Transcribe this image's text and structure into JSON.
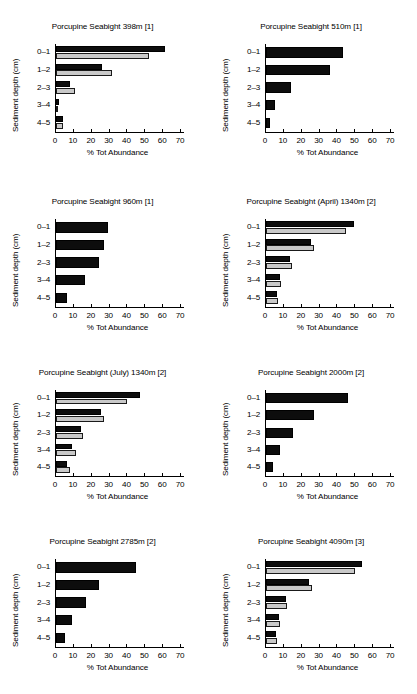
{
  "figure": {
    "panel_count": 8,
    "columns": 2,
    "rows": 4
  },
  "axes": {
    "xlabel": "% Tot Abundance",
    "ylabel": "Sediment depth (cm)",
    "xticks": [
      "0",
      "10",
      "20",
      "30",
      "40",
      "50",
      "60",
      "70"
    ],
    "xlim": [
      0,
      70
    ],
    "depth_categories": [
      "0–1",
      "1–2",
      "2–3",
      "3–4",
      "4–5"
    ],
    "grid": false,
    "legend": "none"
  },
  "colors": {
    "series_a": "#0d0d0d",
    "series_b": "#c9c9c9",
    "axis": "#000000",
    "background": "#ffffff"
  },
  "chart_data": [
    {
      "type": "bar",
      "title": "Porcupine Seabight 398m [1]",
      "xlabel": "% Tot Abundance",
      "ylabel": "Sediment depth (cm)",
      "xlim": [
        0,
        70
      ],
      "categories": [
        "0–1",
        "1–2",
        "2–3",
        "3–4",
        "4–5"
      ],
      "series": [
        {
          "name": "series_a",
          "color": "#0d0d0d",
          "values": [
            61,
            26,
            8,
            1.5,
            4
          ]
        },
        {
          "name": "series_b",
          "color": "#c9c9c9",
          "values": [
            52,
            31.5,
            10.5,
            1,
            4
          ]
        }
      ]
    },
    {
      "type": "bar",
      "title": "Porcupine Seabight 510m [1]",
      "xlabel": "% Tot Abundance",
      "ylabel": "Sediment depth (cm)",
      "xlim": [
        0,
        70
      ],
      "categories": [
        "0–1",
        "1–2",
        "2–3",
        "3–4",
        "4–5"
      ],
      "series": [
        {
          "name": "series_a",
          "color": "#0d0d0d",
          "values": [
            43,
            36,
            14,
            5,
            2.5
          ]
        }
      ]
    },
    {
      "type": "bar",
      "title": "Porcupine Seabight 960m [1]",
      "xlabel": "% Tot Abundance",
      "ylabel": "Sediment depth (cm)",
      "xlim": [
        0,
        70
      ],
      "categories": [
        "0–1",
        "1–2",
        "2–3",
        "3–4",
        "4–5"
      ],
      "series": [
        {
          "name": "series_a",
          "color": "#0d0d0d",
          "values": [
            29,
            27,
            24,
            16,
            6
          ]
        }
      ]
    },
    {
      "type": "bar",
      "title": "Porcupine Seabight (April) 1340m [2]",
      "xlabel": "% Tot Abundance",
      "ylabel": "Sediment depth (cm)",
      "xlim": [
        0,
        70
      ],
      "categories": [
        "0–1",
        "1–2",
        "2–3",
        "3–4",
        "4–5"
      ],
      "series": [
        {
          "name": "series_a",
          "color": "#0d0d0d",
          "values": [
            49,
            25,
            13.5,
            8,
            6
          ]
        },
        {
          "name": "series_b",
          "color": "#c9c9c9",
          "values": [
            45,
            27,
            14.5,
            8.5,
            6.5
          ]
        }
      ]
    },
    {
      "type": "bar",
      "title": "Porcupine Seabight (July) 1340m [2]",
      "xlabel": "% Tot Abundance",
      "ylabel": "Sediment depth (cm)",
      "xlim": [
        0,
        70
      ],
      "categories": [
        "0–1",
        "1–2",
        "2–3",
        "3–4",
        "4–5"
      ],
      "series": [
        {
          "name": "series_a",
          "color": "#0d0d0d",
          "values": [
            47,
            25,
            14,
            9,
            6
          ]
        },
        {
          "name": "series_b",
          "color": "#c9c9c9",
          "values": [
            40,
            27,
            15,
            11,
            8
          ]
        }
      ]
    },
    {
      "type": "bar",
      "title": "Porcupine Seabight 2000m [2]",
      "xlabel": "% Tot Abundance",
      "ylabel": "Sediment depth (cm)",
      "xlim": [
        0,
        70
      ],
      "categories": [
        "0–1",
        "1–2",
        "2–3",
        "3–4",
        "4–5"
      ],
      "series": [
        {
          "name": "series_a",
          "color": "#0d0d0d",
          "values": [
            46,
            27,
            15,
            8,
            4
          ]
        }
      ]
    },
    {
      "type": "bar",
      "title": "Porcupine Seabight 2785m [2]",
      "xlabel": "% Tot Abundance",
      "ylabel": "Sediment depth (cm)",
      "xlim": [
        0,
        70
      ],
      "categories": [
        "0–1",
        "1–2",
        "2–3",
        "3–4",
        "4–5"
      ],
      "series": [
        {
          "name": "series_a",
          "color": "#0d0d0d",
          "values": [
            45,
            24,
            17,
            9,
            5
          ]
        }
      ]
    },
    {
      "type": "bar",
      "title": "Porcupine Seabight 4090m [3]",
      "xlabel": "% Tot Abundance",
      "ylabel": "Sediment depth (cm)",
      "xlim": [
        0,
        70
      ],
      "categories": [
        "0–1",
        "1–2",
        "2–3",
        "3–4",
        "4–5"
      ],
      "series": [
        {
          "name": "series_a",
          "color": "#0d0d0d",
          "values": [
            54,
            24,
            11,
            7,
            5.5
          ]
        },
        {
          "name": "series_b",
          "color": "#c9c9c9",
          "values": [
            50,
            26,
            12,
            8,
            6
          ]
        }
      ]
    }
  ]
}
